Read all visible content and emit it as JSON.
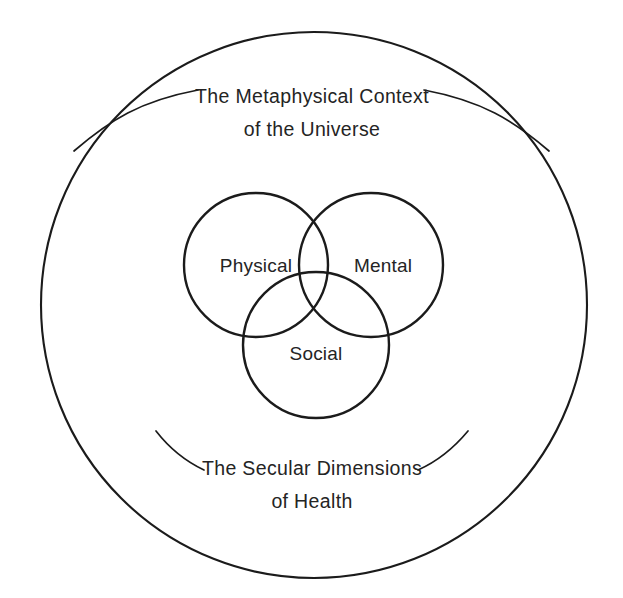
{
  "diagram": {
    "type": "venn-in-circle",
    "title_top_line1": "The Metaphysical Context",
    "title_top_line2": "of the Universe",
    "title_bottom_line1": "The Secular Dimensions",
    "title_bottom_line2": "of Health",
    "background_color": "#ffffff",
    "stroke_color": "#1b1b1b",
    "text_color": "#242424",
    "outer_circle": {
      "label_line1": "The Metaphysical Context",
      "label_line2": "of the Universe",
      "cx": 314,
      "cy": 305,
      "r": 273
    },
    "venn": {
      "sets": [
        {
          "name": "Physical",
          "label": "Physical",
          "cx": 256,
          "cy": 265,
          "r": 72
        },
        {
          "name": "Mental",
          "label": "Mental",
          "cx": 371,
          "cy": 265,
          "r": 72
        },
        {
          "name": "Social",
          "label": "Social",
          "cx": 316,
          "cy": 345,
          "r": 73
        }
      ]
    },
    "bands": [
      {
        "name": "metaphysical-band",
        "line1": "The Metaphysical Context",
        "line2": "of the Universe",
        "position": "top"
      },
      {
        "name": "secular-band",
        "line1": "The Secular Dimensions",
        "line2": "of Health",
        "position": "bottom"
      }
    ],
    "decorative_arcs": [
      {
        "name": "arc-top-left"
      },
      {
        "name": "arc-top-right"
      },
      {
        "name": "arc-bottom-left"
      },
      {
        "name": "arc-bottom-right"
      }
    ]
  }
}
